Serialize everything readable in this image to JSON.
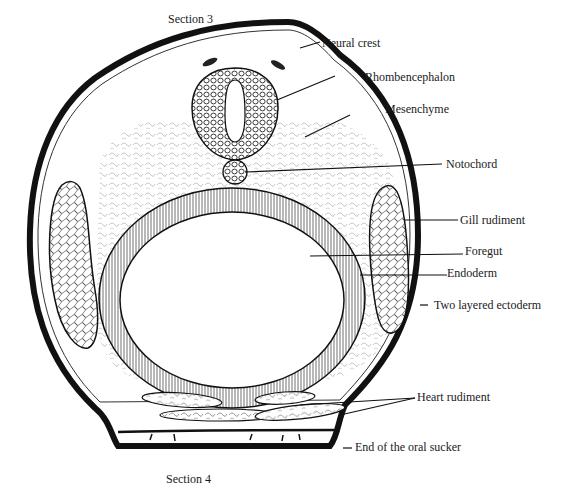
{
  "figure": {
    "top_caption": "Section 3",
    "bottom_caption": "Section 4"
  },
  "labels": {
    "neural_crest": "Neural crest",
    "rhombencephalon": "Rhombencephalon",
    "mesenchyme": "Mesenchyme",
    "notochord": "Notochord",
    "gill_rudiment": "Gill rudiment",
    "foregut": "Foregut",
    "endoderm": "Endoderm",
    "ectoderm": "Two layered ectoderm",
    "heart_rudiment": "Heart rudiment",
    "oral_sucker": "End of the oral sucker"
  },
  "colors": {
    "ink": "#1a1a1a",
    "paper": "#ffffff"
  }
}
